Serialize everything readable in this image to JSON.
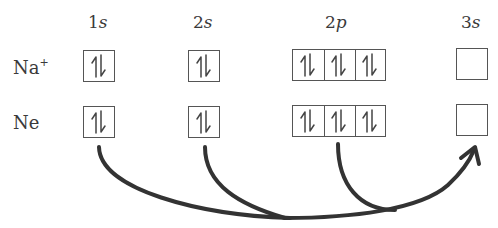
{
  "diagram": {
    "orbital_headers": [
      {
        "num": "1",
        "letter": "s"
      },
      {
        "num": "2",
        "letter": "s"
      },
      {
        "num": "2",
        "letter": "p"
      },
      {
        "num": "3",
        "letter": "s"
      }
    ],
    "rows": [
      {
        "species": "Na",
        "charge": "+",
        "orbitals": {
          "1s": "paired",
          "2s": "paired",
          "2p": [
            "paired",
            "paired",
            "paired"
          ],
          "3s": "empty"
        }
      },
      {
        "species": "Ne",
        "charge": "",
        "orbitals": {
          "1s": "paired",
          "2s": "paired",
          "2p": [
            "paired",
            "paired",
            "paired"
          ],
          "3s": "empty"
        }
      }
    ],
    "arrows": [
      {
        "from": "Ne 1s",
        "to": "Ne 3s"
      },
      {
        "from": "Ne 2s",
        "to": "Ne 3s"
      },
      {
        "from": "Ne 2p",
        "to": "Ne 3s"
      }
    ],
    "colors": {
      "line": "#333333",
      "box": "#555555",
      "text": "#3a3a3a"
    }
  }
}
